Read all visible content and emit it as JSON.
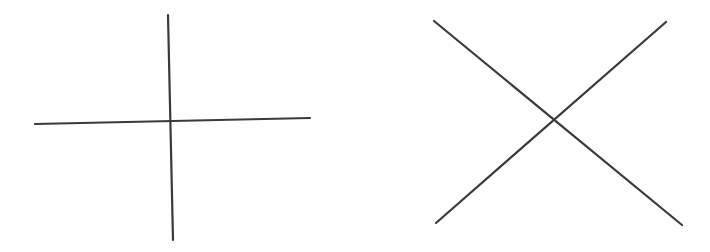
{
  "figure": {
    "stroke_color": "#3a3a3a",
    "background": "#ffffff",
    "panels": [
      {
        "name": "plus-cross",
        "lines": [
          {
            "x1": 168,
            "y1": 15,
            "x2": 173,
            "y2": 240
          },
          {
            "x1": 35,
            "y1": 124,
            "x2": 310,
            "y2": 118
          }
        ]
      },
      {
        "name": "x-cross",
        "lines": [
          {
            "x1": 434,
            "y1": 21,
            "x2": 682,
            "y2": 225
          },
          {
            "x1": 666,
            "y1": 22,
            "x2": 436,
            "y2": 223
          }
        ]
      }
    ]
  }
}
